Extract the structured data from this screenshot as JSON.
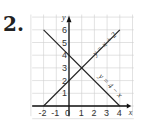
{
  "problem_number": "2.",
  "chart_data": {
    "type": "line",
    "title": "",
    "xlabel": "x",
    "ylabel": "y",
    "xlim": [
      -2,
      4
    ],
    "ylim": [
      0,
      6
    ],
    "x_ticks": [
      "-2",
      "-1",
      "0",
      "1",
      "2",
      "3",
      "4"
    ],
    "y_ticks": [
      "1",
      "2",
      "3",
      "4",
      "5",
      "6"
    ],
    "grid": true,
    "series": [
      {
        "name": "y = x + 2",
        "x": [
          -2,
          4
        ],
        "y": [
          0,
          6
        ]
      },
      {
        "name": "y = 4 − x",
        "x": [
          -2,
          4
        ],
        "y": [
          6,
          0
        ]
      }
    ],
    "intersection": {
      "x": 1,
      "y": 3
    }
  }
}
